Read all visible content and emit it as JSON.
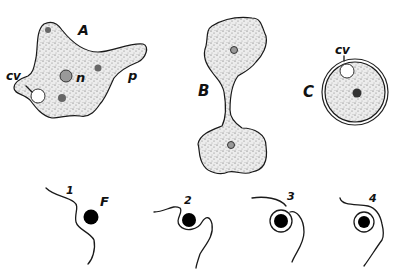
{
  "figure": {
    "panels": [
      {
        "id": "A",
        "label": "A",
        "description": "amoeba in locomotion",
        "parts": [
          {
            "label": "cv",
            "meaning": "contractile vacuole"
          },
          {
            "label": "n",
            "meaning": "nucleus"
          },
          {
            "label": "p",
            "meaning": "pseudopodium"
          }
        ]
      },
      {
        "id": "B",
        "label": "B",
        "description": "amoeba undergoing binary fission"
      },
      {
        "id": "C",
        "label": "C",
        "description": "encysted amoeba",
        "parts": [
          {
            "label": "cv",
            "meaning": "contractile vacuole"
          }
        ]
      }
    ],
    "feeding_sequence": {
      "particle_label": "F",
      "stages": [
        "1",
        "2",
        "3",
        "4"
      ]
    }
  },
  "labels": {
    "A": "A",
    "A_cv": "cv",
    "A_n": "n",
    "A_p": "p",
    "B": "B",
    "C": "C",
    "C_cv": "cv",
    "stage1": "1",
    "stage2": "2",
    "stage3": "3",
    "stage4": "4",
    "food": "F"
  },
  "colors": {
    "ink": "#1a1a1a",
    "background": "#ffffff",
    "cytoplasm": "#e9e9e9"
  }
}
